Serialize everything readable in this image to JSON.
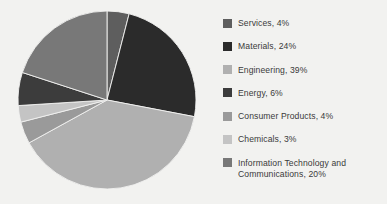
{
  "background_color": "#f2f2f0",
  "legend": {
    "position": "right",
    "items": [
      {
        "label": "Services, 4%",
        "name": "Services",
        "value": 4,
        "color": "#5e5e5e"
      },
      {
        "label": "Materials, 24%",
        "name": "Materials",
        "value": 24,
        "color": "#2b2b2b"
      },
      {
        "label": "Engineering, 39%",
        "name": "Engineering",
        "value": 39,
        "color": "#b0b0b0"
      },
      {
        "label": "Energy, 6%",
        "name": "Energy",
        "value": 6,
        "color": "#3c3c3c"
      },
      {
        "label": "Consumer Products, 4%",
        "name": "Consumer Products",
        "value": 4,
        "color": "#9a9a9a"
      },
      {
        "label": "Chemicals, 3%",
        "name": "Chemicals",
        "value": 3,
        "color": "#c4c4c4"
      },
      {
        "label": "Information Technology and\nCommunications, 20%",
        "name": "Information Technology and Communications",
        "value": 20,
        "color": "#787878"
      }
    ]
  },
  "chart_data": {
    "type": "pie",
    "title": "",
    "xlabel": "",
    "ylabel": "",
    "start_angle_deg": 0,
    "direction": "clockwise",
    "units": "percent",
    "categories": [
      "Services",
      "Materials",
      "Engineering",
      "Consumer Products",
      "Chemicals",
      "Energy",
      "Information Technology and Communications"
    ],
    "values": [
      4,
      24,
      39,
      4,
      3,
      6,
      20
    ],
    "colors": [
      "#5e5e5e",
      "#2b2b2b",
      "#b0b0b0",
      "#9a9a9a",
      "#c4c4c4",
      "#3c3c3c",
      "#787878"
    ],
    "labels": [
      "Services, 4%",
      "Materials, 24%",
      "Engineering, 39%",
      "Consumer Products, 4%",
      "Chemicals, 3%",
      "Energy, 6%",
      "Information Technology and Communications, 20%"
    ],
    "total": 100,
    "legend_position": "right",
    "grid": false,
    "geometry": {
      "cx": 107,
      "cy": 100,
      "r": 89
    }
  }
}
